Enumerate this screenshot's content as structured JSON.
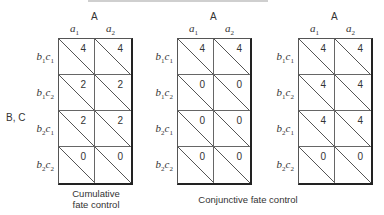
{
  "axis": {
    "column_factor": "A",
    "column_levels": [
      "a1",
      "a2"
    ],
    "row_factor": "B, C",
    "row_levels": [
      "b1c1",
      "b1c2",
      "b2c1",
      "b2c2"
    ]
  },
  "panels": [
    {
      "caption": "Cumulative fate control",
      "caption_lines": [
        "Cumulative",
        "fate control"
      ],
      "values": [
        [
          4,
          4
        ],
        [
          2,
          2
        ],
        [
          2,
          2
        ],
        [
          0,
          0
        ]
      ]
    },
    {
      "caption": "Conjunctive fate control",
      "values": [
        [
          4,
          4
        ],
        [
          0,
          0
        ],
        [
          0,
          0
        ],
        [
          0,
          0
        ]
      ]
    },
    {
      "caption": "Conjunctive fate control",
      "values": [
        [
          4,
          4
        ],
        [
          4,
          4
        ],
        [
          4,
          4
        ],
        [
          0,
          0
        ]
      ]
    }
  ],
  "shared_caption": "Conjunctive fate control",
  "labels": {
    "A": "A",
    "a1": "a",
    "a1_sub": "1",
    "a2": "a",
    "a2_sub": "2",
    "BC": "B, C",
    "r": [
      {
        "b": "b",
        "bs": "1",
        "c": "c",
        "cs": "1"
      },
      {
        "b": "b",
        "bs": "1",
        "c": "c",
        "cs": "2"
      },
      {
        "b": "b",
        "bs": "2",
        "c": "c",
        "cs": "1"
      },
      {
        "b": "b",
        "bs": "2",
        "c": "c",
        "cs": "2"
      }
    ]
  },
  "chart_data": {
    "type": "table",
    "columns": [
      "a1",
      "a2"
    ],
    "rows": [
      "b1c1",
      "b1c2",
      "b2c1",
      "b2c2"
    ],
    "tables": [
      {
        "name": "Cumulative fate control",
        "values": [
          [
            4,
            4
          ],
          [
            2,
            2
          ],
          [
            2,
            2
          ],
          [
            0,
            0
          ]
        ]
      },
      {
        "name": "Conjunctive fate control (1)",
        "values": [
          [
            4,
            4
          ],
          [
            0,
            0
          ],
          [
            0,
            0
          ],
          [
            0,
            0
          ]
        ]
      },
      {
        "name": "Conjunctive fate control (2)",
        "values": [
          [
            4,
            4
          ],
          [
            4,
            4
          ],
          [
            4,
            4
          ],
          [
            0,
            0
          ]
        ]
      }
    ]
  }
}
